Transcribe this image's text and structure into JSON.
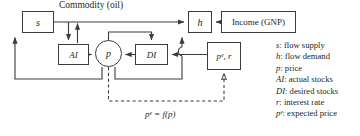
{
  "diagram": {
    "title_caption": "Commodity (oil)",
    "equation": "pᵉ = f(p)",
    "nodes": {
      "supply": "s",
      "demand": "h",
      "income": "Income (GNP)",
      "actual_stocks": "AI",
      "desired_stocks": "DI",
      "price": "p",
      "expected_price_rate": "pᵉ, r"
    },
    "colors": {
      "stroke": "#3b3b3b",
      "text": "#231f20",
      "background": "#ffffff"
    }
  },
  "legend": {
    "items": [
      {
        "symbol": "s",
        "definition": ": flow supply"
      },
      {
        "symbol": "h",
        "definition": ": flow demand"
      },
      {
        "symbol": "p",
        "definition": ": price"
      },
      {
        "symbol": "AI",
        "definition": ": actual stocks"
      },
      {
        "symbol": "DI",
        "definition": ": desired stocks"
      },
      {
        "symbol": "r",
        "definition": ": interest rate"
      },
      {
        "symbol": "pᵉ",
        "definition": ": expected price"
      }
    ]
  }
}
